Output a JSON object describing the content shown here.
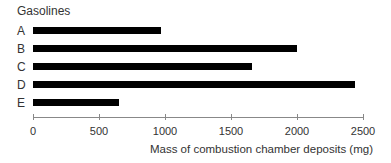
{
  "chart_data": {
    "type": "bar",
    "orientation": "horizontal",
    "title": "Gasolines",
    "categories": [
      "A",
      "B",
      "C",
      "D",
      "E"
    ],
    "values": [
      970,
      2000,
      1660,
      2440,
      650
    ],
    "xlabel": "Mass of combustion chamber deposits (mg)",
    "ylabel": "Gasolines",
    "xlim": [
      0,
      2500
    ],
    "xticks": [
      0,
      500,
      1000,
      1500,
      2000,
      2500
    ],
    "xtick_labels": [
      "0",
      "500",
      "1000",
      "1500",
      "2000",
      "2500"
    ],
    "grid": false,
    "legend": null,
    "bar_color": "#000000"
  }
}
